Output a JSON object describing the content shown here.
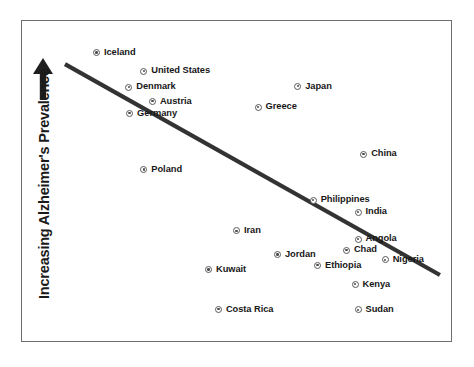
{
  "figure": {
    "type": "scatter-plot",
    "background_color": "#ffffff",
    "frame_color": "#6e6e6e",
    "marker_color": "#5a5a5a",
    "label_color": "#171717",
    "trend_line_color": "#333333"
  },
  "axes": {
    "y_label": "Increasing Alzheimer's Prevalence",
    "y_arrow_icon": "up-arrow-icon",
    "x_label": "",
    "ticks": []
  },
  "chart_data": {
    "type": "scatter",
    "title": "",
    "xlabel": "",
    "ylabel": "Increasing Alzheimer's Prevalence",
    "xlim": [
      0,
      100
    ],
    "ylim": [
      0,
      100
    ],
    "grid": false,
    "legend": "none",
    "axis_ticks_shown": false,
    "annotations": [
      {
        "name": "trend-line",
        "type": "line",
        "description": "downward sloping trend line",
        "x": [
          10.2,
          97.2
        ],
        "y": [
          86.3,
          20.8
        ]
      },
      {
        "name": "y-axis-arrow",
        "type": "arrow",
        "description": "upward arrow indicating increasing prevalence"
      }
    ],
    "points": [
      {
        "label": "Iceland",
        "x": 17.5,
        "y": 90.0,
        "label_side": "right"
      },
      {
        "label": "United States",
        "x": 28.5,
        "y": 84.2,
        "label_side": "right"
      },
      {
        "label": "Denmark",
        "x": 25.0,
        "y": 79.2,
        "label_side": "right"
      },
      {
        "label": "Austria",
        "x": 30.5,
        "y": 74.8,
        "label_side": "right"
      },
      {
        "label": "Germany",
        "x": 25.2,
        "y": 71.1,
        "label_side": "right"
      },
      {
        "label": "Japan",
        "x": 64.2,
        "y": 79.5,
        "label_side": "right"
      },
      {
        "label": "Greece",
        "x": 55.0,
        "y": 73.0,
        "label_side": "right"
      },
      {
        "label": "China",
        "x": 79.5,
        "y": 58.4,
        "label_side": "right"
      },
      {
        "label": "Poland",
        "x": 28.5,
        "y": 53.6,
        "label_side": "right"
      },
      {
        "label": "Philippines",
        "x": 67.8,
        "y": 44.1,
        "label_side": "right"
      },
      {
        "label": "India",
        "x": 78.2,
        "y": 40.4,
        "label_side": "right"
      },
      {
        "label": "Iran",
        "x": 50.0,
        "y": 34.6,
        "label_side": "right"
      },
      {
        "label": "Angola",
        "x": 78.2,
        "y": 32.0,
        "label_side": "right"
      },
      {
        "label": "Chad",
        "x": 75.5,
        "y": 28.6,
        "label_side": "right"
      },
      {
        "label": "Jordan",
        "x": 59.5,
        "y": 27.2,
        "label_side": "right"
      },
      {
        "label": "Nigeria",
        "x": 84.5,
        "y": 25.6,
        "label_side": "right"
      },
      {
        "label": "Ethiopia",
        "x": 68.8,
        "y": 23.9,
        "label_side": "right"
      },
      {
        "label": "Kuwait",
        "x": 43.5,
        "y": 22.6,
        "label_side": "right"
      },
      {
        "label": "Kenya",
        "x": 77.5,
        "y": 18.0,
        "label_side": "right"
      },
      {
        "label": "Costa Rica",
        "x": 45.8,
        "y": 10.2,
        "label_side": "right"
      },
      {
        "label": "Sudan",
        "x": 78.2,
        "y": 10.0,
        "label_side": "right"
      }
    ]
  }
}
